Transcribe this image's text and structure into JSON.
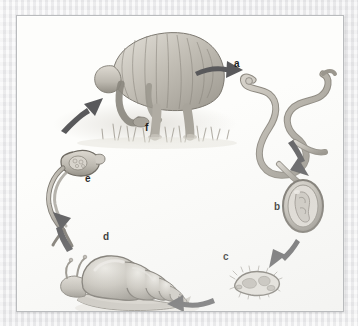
{
  "figure": {
    "type": "life-cycle-diagram",
    "title": "",
    "style": "grayscale pencil illustration on cream paper with thin gray frame",
    "arrangement": "clockwise circular cycle with six labeled stages",
    "frame": {
      "border_color": "#b9bbbd",
      "page_color": "#fdfdfb",
      "margin_color": "#ececed"
    },
    "palette": {
      "ink": "#1d1d1d",
      "arrow": "#59595b",
      "illustration_light": "#d9d6cf",
      "illustration_mid": "#b3afa6",
      "illustration_dark": "#8a867d",
      "outline": "#6f6b63"
    }
  },
  "stages": [
    {
      "id": "f",
      "label": "f",
      "name": "human-host-in-water",
      "description": "Person bending over working in flooded field with grass",
      "label_x": 144,
      "label_y": 122
    },
    {
      "id": "a",
      "label": "a",
      "name": "adult-worm",
      "description": "Adult fluke / paired worms",
      "label_x": 233,
      "label_y": 58
    },
    {
      "id": "b",
      "label": "b",
      "name": "egg",
      "description": "Oval egg containing developing embryo",
      "label_x": 273,
      "label_y": 201
    },
    {
      "id": "c",
      "label": "c",
      "name": "miracidium",
      "description": "Free-swimming ciliated miracidium larva",
      "label_x": 222,
      "label_y": 251
    },
    {
      "id": "d",
      "label": "d",
      "name": "snail-intermediate-host",
      "description": "Snail intermediate host with spiral shell",
      "label_x": 102,
      "label_y": 231
    },
    {
      "id": "e",
      "label": "e",
      "name": "cercaria",
      "description": "Fork-tailed cercaria larva",
      "label_x": 84,
      "label_y": 173
    }
  ],
  "arrows": [
    {
      "name": "arrow-f-to-a",
      "from": "f",
      "to": "a",
      "direction": "right"
    },
    {
      "name": "arrow-a-to-b",
      "from": "a",
      "to": "b",
      "direction": "down-right"
    },
    {
      "name": "arrow-b-to-c",
      "from": "b",
      "to": "c",
      "direction": "down-left"
    },
    {
      "name": "arrow-c-to-d",
      "from": "c",
      "to": "d",
      "direction": "left"
    },
    {
      "name": "arrow-d-to-e",
      "from": "d",
      "to": "e",
      "direction": "up-left"
    },
    {
      "name": "arrow-e-to-f",
      "from": "e",
      "to": "f",
      "direction": "up-right"
    }
  ]
}
